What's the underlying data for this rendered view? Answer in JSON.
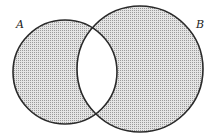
{
  "diagram": {
    "type": "venn",
    "shaded_region": "symmetric difference (A xor B)",
    "sets": [
      {
        "label": "A",
        "cx": 65,
        "cy": 72,
        "r": 52
      },
      {
        "label": "B",
        "cx": 140,
        "cy": 69,
        "r": 63
      }
    ],
    "colors": {
      "stroke": "#2a2a2a",
      "fill": "#cfcfcf",
      "background": "#ffffff"
    }
  }
}
